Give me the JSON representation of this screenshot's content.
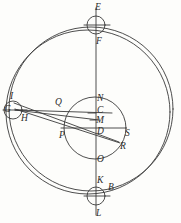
{
  "figure": {
    "background_color": "#fdfdfb",
    "stroke_color": "#3a3a3a",
    "width": 181,
    "height": 223
  },
  "labels": [
    {
      "id": "E",
      "text": "E",
      "x": 95,
      "y": 3,
      "note": "above top small circle"
    },
    {
      "id": "F",
      "text": "F",
      "x": 96,
      "y": 37,
      "note": "below top small circle"
    },
    {
      "id": "I",
      "text": "I",
      "x": 10,
      "y": 92,
      "note": "above left small circle"
    },
    {
      "id": "G",
      "text": "G",
      "x": 4,
      "y": 110,
      "note": "inside left small circle"
    },
    {
      "id": "H",
      "text": "H",
      "x": 21,
      "y": 117,
      "note": "below right of left small circle"
    },
    {
      "id": "Q",
      "text": "Q",
      "x": 55,
      "y": 100,
      "note": "above upper chord line"
    },
    {
      "id": "N",
      "text": "N",
      "x": 97,
      "y": 97,
      "note": "top of central circle"
    },
    {
      "id": "C",
      "text": "C",
      "x": 97,
      "y": 110,
      "note": "on vertical axis"
    },
    {
      "id": "M",
      "text": "M",
      "x": 96,
      "y": 120,
      "note": "on vertical axis"
    },
    {
      "id": "D",
      "text": "D",
      "x": 97,
      "y": 131,
      "note": "centre of central circle"
    },
    {
      "id": "P",
      "text": "P",
      "x": 59,
      "y": 135,
      "note": "left end of horizontal diameter"
    },
    {
      "id": "S",
      "text": "S",
      "x": 124,
      "y": 133,
      "note": "right end of horizontal diameter"
    },
    {
      "id": "R",
      "text": "R",
      "x": 120,
      "y": 146,
      "note": "lower right, on oblique line"
    },
    {
      "id": "O",
      "text": "O",
      "x": 97,
      "y": 159,
      "note": "bottom of central circle"
    },
    {
      "id": "K",
      "text": "K",
      "x": 97,
      "y": 179,
      "note": "above bottom small circle"
    },
    {
      "id": "B",
      "text": "B",
      "x": 108,
      "y": 186,
      "note": "right of bottom small circle"
    },
    {
      "id": "L",
      "text": "L",
      "x": 96,
      "y": 212,
      "note": "below bottom small circle"
    }
  ],
  "shapes": {
    "outer_circle_1": {
      "name": "outer-eccentric-circle",
      "cx": 88,
      "cy": 112,
      "r": 82
    },
    "outer_circle_2": {
      "name": "outer-deferent-circle",
      "cx": 91,
      "cy": 109,
      "r": 82
    },
    "central_circle": {
      "name": "central-epicycle",
      "cx": 95,
      "cy": 128,
      "r": 31
    },
    "top_circle": {
      "name": "top-small-circle",
      "cx": 96,
      "cy": 25,
      "r": 9
    },
    "bottom_circle": {
      "name": "bottom-small-circle",
      "cx": 96,
      "cy": 196,
      "r": 9
    },
    "left_circle": {
      "name": "left-small-circle",
      "cx": 13,
      "cy": 110,
      "r": 9
    }
  },
  "lines": {
    "vertical_axis": {
      "name": "vertical-axis-E-L",
      "x1": 96,
      "y1": 8,
      "x2": 96,
      "y2": 215
    },
    "horizontal_P_S": {
      "name": "horizontal-diameter-P-S",
      "x1": 61,
      "y1": 128,
      "x2": 126,
      "y2": 128
    },
    "top_chord": {
      "name": "top-circle-chord",
      "x1": 84,
      "y1": 25,
      "x2": 110,
      "y2": 25
    },
    "bottom_chord": {
      "name": "bottom-circle-chord",
      "x1": 84,
      "y1": 196,
      "x2": 110,
      "y2": 196
    },
    "left_chord": {
      "name": "left-circle-chord",
      "x1": 4,
      "y1": 110,
      "x2": 26,
      "y2": 110
    },
    "ray_G_to_Q_C": {
      "name": "ray-G-to-C",
      "x1": 15,
      "y1": 110,
      "x2": 110,
      "y2": 113
    },
    "ray_G_to_M": {
      "name": "ray-G-to-M",
      "x1": 15,
      "y1": 110,
      "x2": 99,
      "y2": 119
    },
    "ray_G_to_R": {
      "name": "ray-G-to-R",
      "x1": 15,
      "y1": 109,
      "x2": 120,
      "y2": 143
    },
    "ray_I_to_R": {
      "name": "ray-I-to-R",
      "x1": 14,
      "y1": 103,
      "x2": 119,
      "y2": 142
    }
  }
}
